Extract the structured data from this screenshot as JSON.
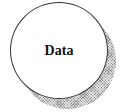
{
  "node": {
    "label": "Data",
    "shape": "circle",
    "has_shadow": true
  },
  "colors": {
    "fill": "#ffffff",
    "outline": "#333333",
    "shadow": "#8a8a8a",
    "text": "#111111"
  }
}
